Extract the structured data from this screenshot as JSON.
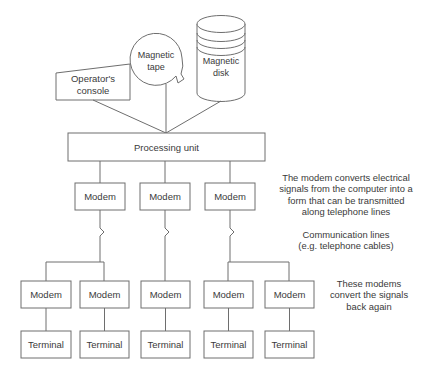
{
  "diagram": {
    "colors": {
      "stroke": "#6e6e6e",
      "text": "#3a3a3a",
      "background": "#ffffff"
    },
    "devices": {
      "operator_console": "Operator's\nconsole",
      "operator_console_line1": "Operator's",
      "operator_console_line2": "console",
      "magnetic_tape_line1": "Magnetic",
      "magnetic_tape_line2": "tape",
      "magnetic_disk_line1": "Magnetic",
      "magnetic_disk_line2": "disk",
      "processing_unit": "Processing unit"
    },
    "modems_top": [
      {
        "label": "Modem"
      },
      {
        "label": "Modem"
      },
      {
        "label": "Modem"
      }
    ],
    "modems_bottom": [
      {
        "label": "Modem"
      },
      {
        "label": "Modem"
      },
      {
        "label": "Modem"
      },
      {
        "label": "Modem"
      },
      {
        "label": "Modem"
      }
    ],
    "terminals": [
      {
        "label": "Terminal"
      },
      {
        "label": "Terminal"
      },
      {
        "label": "Terminal"
      },
      {
        "label": "Terminal"
      },
      {
        "label": "Terminal"
      }
    ],
    "notes": {
      "modem_convert": "The modem converts electrical\nsignals from the computer into a\nform that can be transmitted\nalong telephone lines",
      "communication_lines": "Communication lines\n(e.g. telephone cables)",
      "modems_back": "These modems\nconvert the signals\nback again"
    }
  }
}
